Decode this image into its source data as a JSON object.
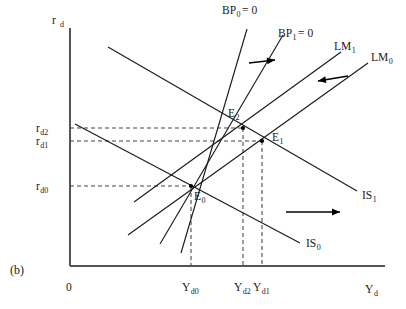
{
  "figure": {
    "panel_label": "(b)",
    "origin_label": "0",
    "axes": {
      "y_label_main": "r",
      "y_label_sub": "d",
      "x_label_main": "Y",
      "x_label_sub": "d"
    },
    "y_ticks": [
      {
        "name": "r_d2",
        "main": "r",
        "sub": "d2",
        "y": 128
      },
      {
        "name": "r_d1",
        "main": "r",
        "sub": "d1",
        "y": 141
      },
      {
        "name": "r_d0",
        "main": "r",
        "sub": "d0",
        "y": 186
      }
    ],
    "x_ticks": [
      {
        "name": "Y_d0",
        "main": "Y",
        "sub": "d0",
        "x": 191
      },
      {
        "name": "Y_d2",
        "main": "Y",
        "sub": "d2",
        "x": 243
      },
      {
        "name": "Y_d1",
        "main": "Y",
        "sub": "d1",
        "x": 262
      }
    ],
    "equilibria": [
      {
        "name": "E_0",
        "main": "E",
        "sub": "0",
        "x": 191,
        "y": 186,
        "label_x": 194,
        "label_y": 200
      },
      {
        "name": "E_1",
        "main": "E",
        "sub": "1",
        "x": 262,
        "y": 141,
        "label_x": 272,
        "label_y": 141
      },
      {
        "name": "E_2",
        "main": "E",
        "sub": "2",
        "x": 243,
        "y": 128,
        "label_x": 228,
        "label_y": 117
      }
    ],
    "curves": [
      {
        "name": "IS_0",
        "main": "IS",
        "sub": "0",
        "x1": 75,
        "y1": 124,
        "x2": 300,
        "y2": 243,
        "label_x": 306,
        "label_y": 247
      },
      {
        "name": "IS_1",
        "main": "IS",
        "sub": "1",
        "x1": 108,
        "y1": 47,
        "x2": 357,
        "y2": 191,
        "label_x": 362,
        "label_y": 199
      },
      {
        "name": "LM_0",
        "main": "LM",
        "sub": "0",
        "x1": 128,
        "y1": 235,
        "x2": 368,
        "y2": 63,
        "label_x": 371,
        "label_y": 61
      },
      {
        "name": "LM_1",
        "main": "LM",
        "sub": "1",
        "x1": 134,
        "y1": 202,
        "x2": 341,
        "y2": 52,
        "label_x": 334,
        "label_y": 50
      },
      {
        "name": "BP_0 = 0",
        "main": "BP",
        "sub": "0",
        "eq": " = 0",
        "x1": 181,
        "y1": 253,
        "x2": 247,
        "y2": 29,
        "label_x": 222,
        "label_y": 14
      },
      {
        "name": "BP_1 = 0",
        "main": "BP",
        "sub": "1",
        "eq": " = 0",
        "x1": 160,
        "y1": 244,
        "x2": 283,
        "y2": 35,
        "label_x": 278,
        "label_y": 37
      }
    ],
    "shift_arrows": [
      {
        "name": "bp-shift-arrow",
        "direction": "right",
        "x1": 249,
        "y1": 63,
        "x2": 275,
        "y2": 60
      },
      {
        "name": "lm-shift-arrow",
        "direction": "left",
        "x1": 348,
        "y1": 76,
        "x2": 318,
        "y2": 81
      },
      {
        "name": "is-shift-arrow",
        "direction": "right",
        "x1": 286,
        "y1": 212,
        "x2": 340,
        "y2": 212
      }
    ],
    "colors": {
      "ink": "#1a1a1a",
      "axis": "#555555",
      "dash": "#444444",
      "background": "#ffffff"
    }
  }
}
